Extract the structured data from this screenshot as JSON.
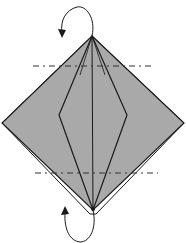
{
  "diagram": {
    "type": "origami-fold-step",
    "colors": {
      "paper_fill": "#a9a9a9",
      "line": "#1a1a1a",
      "background": "#ffffff",
      "underlayer": "#ffffff"
    },
    "shape": {
      "outer_diamond": {
        "top": [
          92,
          36
        ],
        "right": [
          184,
          123
        ],
        "bottom": [
          93,
          210
        ],
        "left": [
          2,
          123
        ]
      },
      "inner_diamond": {
        "top": [
          92,
          36
        ],
        "right": [
          127,
          115
        ],
        "bottom": [
          93,
          210
        ],
        "left": [
          59,
          115
        ]
      },
      "center_line": {
        "from": [
          92,
          36
        ],
        "to": [
          93,
          210
        ]
      }
    },
    "fold_lines": [
      {
        "kind": "valley-dashed",
        "y": 66,
        "x1": 33,
        "x2": 155
      },
      {
        "kind": "valley-dashed",
        "y": 173,
        "x1": 35,
        "x2": 158
      }
    ],
    "arrows": [
      {
        "name": "fold-behind-top",
        "position": "top"
      },
      {
        "name": "fold-behind-bottom",
        "position": "bottom"
      }
    ]
  }
}
